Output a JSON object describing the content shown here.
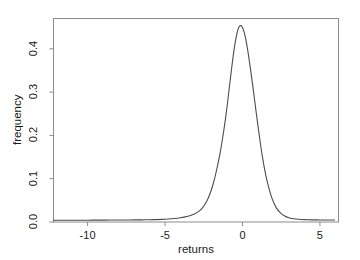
{
  "chart_data": {
    "type": "line",
    "title": "",
    "subtitle": "",
    "xlabel": "returns",
    "ylabel": "frequency",
    "xlim": [
      -12.2,
      6.2
    ],
    "ylim": [
      0.0,
      0.47
    ],
    "grid": false,
    "legend": null,
    "xticks": [
      -10,
      -5,
      0,
      5
    ],
    "xtick_labels": [
      "-10",
      "-5",
      "0",
      "5"
    ],
    "yticks": [
      0.0,
      0.1,
      0.2,
      0.3,
      0.4
    ],
    "ytick_labels": [
      "0.0",
      "0.1",
      "0.2",
      "0.3",
      "0.4"
    ],
    "line_color": "#4d4d4d",
    "axis_color": "#808080",
    "series": [
      {
        "name": "density of returns",
        "x": [
          -12.2,
          -11.6,
          -11.0,
          -10.4,
          -10.0,
          -9.5,
          -9.0,
          -8.5,
          -8.0,
          -7.5,
          -7.0,
          -6.5,
          -6.0,
          -5.6,
          -5.2,
          -4.8,
          -4.4,
          -4.0,
          -3.7,
          -3.4,
          -3.1,
          -2.8,
          -2.6,
          -2.4,
          -2.2,
          -2.0,
          -1.8,
          -1.6,
          -1.45,
          -1.3,
          -1.15,
          -1.0,
          -0.9,
          -0.8,
          -0.7,
          -0.6,
          -0.5,
          -0.4,
          -0.3,
          -0.2,
          -0.1,
          -0.02,
          0.08,
          0.18,
          0.3,
          0.42,
          0.55,
          0.7,
          0.85,
          1.0,
          1.15,
          1.3,
          1.45,
          1.6,
          1.8,
          2.0,
          2.2,
          2.45,
          2.7,
          3.0,
          3.3,
          3.6,
          4.0,
          4.4,
          4.8,
          5.2,
          5.6,
          5.95
        ],
        "y": [
          0.004,
          0.004,
          0.004,
          0.0042,
          0.0042,
          0.0043,
          0.0044,
          0.0045,
          0.0046,
          0.0047,
          0.0048,
          0.005,
          0.0052,
          0.0055,
          0.006,
          0.0068,
          0.008,
          0.0098,
          0.0118,
          0.0145,
          0.0185,
          0.025,
          0.032,
          0.042,
          0.056,
          0.075,
          0.1,
          0.132,
          0.158,
          0.19,
          0.225,
          0.265,
          0.295,
          0.325,
          0.355,
          0.383,
          0.408,
          0.428,
          0.443,
          0.452,
          0.4535,
          0.4505,
          0.442,
          0.428,
          0.405,
          0.378,
          0.345,
          0.305,
          0.263,
          0.222,
          0.183,
          0.148,
          0.118,
          0.093,
          0.066,
          0.046,
          0.032,
          0.021,
          0.0145,
          0.0098,
          0.0075,
          0.0062,
          0.0054,
          0.005,
          0.0048,
          0.0047,
          0.0046,
          0.0046
        ]
      }
    ]
  },
  "axes": {
    "x_axis_name": "returns-axis",
    "y_axis_name": "frequency-axis"
  }
}
